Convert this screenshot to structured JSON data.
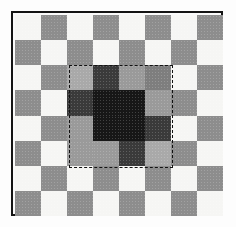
{
  "figure": {
    "frame_border_color": "#141414",
    "page_background": "#fdfdfd",
    "board_background": "#fafafa"
  },
  "selection": {
    "label": "dashed-selection-rectangle",
    "style": "dashed",
    "color": "#111111",
    "left_px": 56,
    "top_px": 52,
    "width_px": 104,
    "height_px": 103,
    "covers_rows": [
      2,
      3,
      4,
      5
    ],
    "covers_cols": [
      2,
      3,
      4,
      5
    ]
  },
  "palette": {
    "white": "#f6f6f4",
    "gray": "#8d8d8d",
    "shadow_white": "#7e7e7e",
    "shadow_gray": "#3a3a3a",
    "core_dark": "#171717",
    "mid_gray": "#9a9a9a",
    "dim_white": "#a9a9a9"
  },
  "chart_data": {
    "type": "heatmap",
    "xlabel": "",
    "ylabel": "",
    "rows": 8,
    "cols": 8,
    "grid": false,
    "legend": "none",
    "cell_labels": [
      "white",
      "gray",
      "shadow_white",
      "shadow_gray",
      "core_dark",
      "mid_gray",
      "dim_white"
    ],
    "values": [
      [
        "white",
        "gray",
        "white",
        "gray",
        "white",
        "gray",
        "white",
        "gray"
      ],
      [
        "gray",
        "white",
        "gray",
        "white",
        "gray",
        "white",
        "gray",
        "white"
      ],
      [
        "white",
        "gray",
        "dim_white",
        "shadow_gray",
        "mid_gray",
        "shadow_white",
        "white",
        "gray"
      ],
      [
        "gray",
        "white",
        "shadow_gray",
        "core_dark",
        "core_dark",
        "mid_gray",
        "gray",
        "white"
      ],
      [
        "white",
        "gray",
        "mid_gray",
        "core_dark",
        "core_dark",
        "shadow_gray",
        "white",
        "gray"
      ],
      [
        "gray",
        "white",
        "mid_gray",
        "mid_gray",
        "shadow_gray",
        "dim_white",
        "gray",
        "white"
      ],
      [
        "white",
        "gray",
        "white",
        "gray",
        "white",
        "gray",
        "white",
        "gray"
      ],
      [
        "gray",
        "white",
        "gray",
        "white",
        "gray",
        "white",
        "gray",
        "white"
      ]
    ]
  }
}
